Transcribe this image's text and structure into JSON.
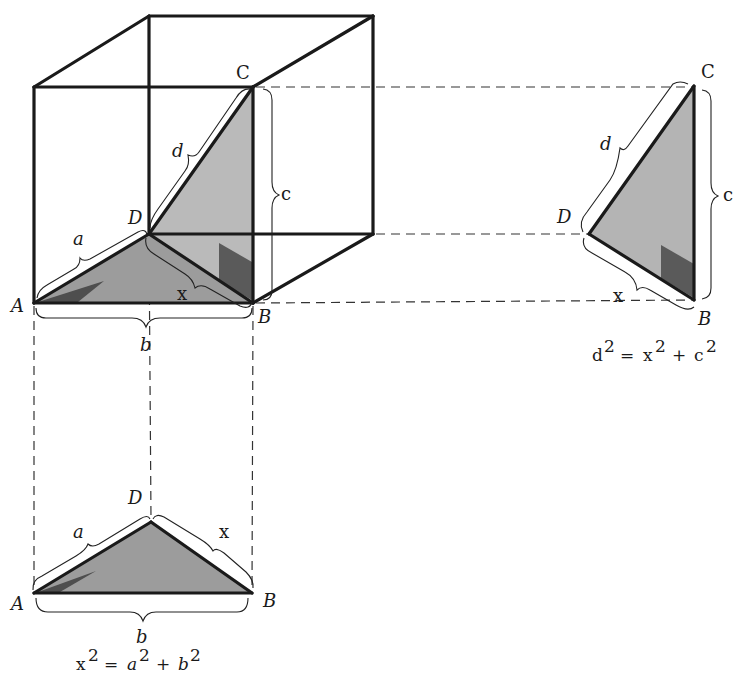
{
  "colors": {
    "line": "#1a1a1a",
    "face_fill": "#b4b4b4",
    "floor_fill": "#9c9c9c",
    "marker_fill": "#5a5a5a",
    "background": "#ffffff"
  },
  "cube": {
    "vertex_labels": {
      "A": "A",
      "B": "B",
      "C": "C",
      "D": "D"
    },
    "edge_labels": {
      "a": "a",
      "b": "b",
      "c": "c",
      "d": "d",
      "x": "x"
    }
  },
  "side_view": {
    "vertex_labels": {
      "C": "C",
      "D": "D",
      "B": "B"
    },
    "edge_labels": {
      "d": "d",
      "c": "c",
      "x": "x"
    },
    "equation": {
      "lhs": "d",
      "rhs1": "x",
      "rhs2": "c",
      "exp": "2",
      "eq": "=",
      "plus": "+"
    }
  },
  "top_view": {
    "vertex_labels": {
      "A": "A",
      "D": "D",
      "B": "B"
    },
    "edge_labels": {
      "a": "a",
      "x": "x",
      "b": "b"
    },
    "equation": {
      "lhs": "x",
      "rhs1": "a",
      "rhs2": "b",
      "exp": "2",
      "eq": "=",
      "plus": "+"
    }
  }
}
